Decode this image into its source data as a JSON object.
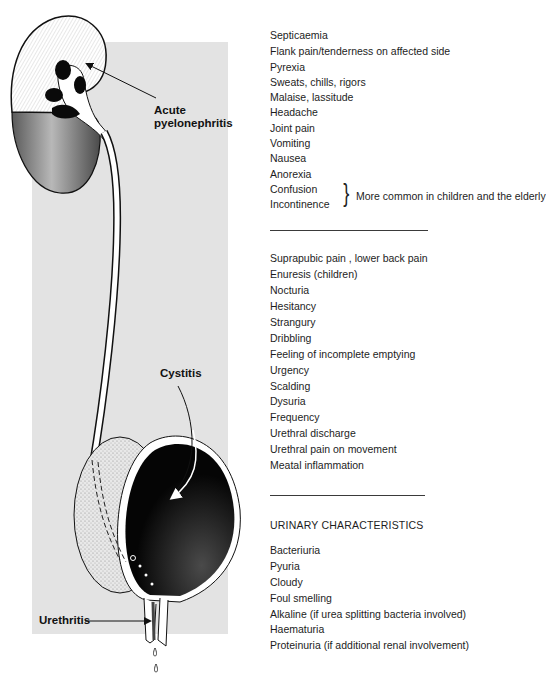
{
  "illustration": {
    "labels": {
      "kidney": [
        "Acute",
        "pyelonephritis"
      ],
      "bladder": "Cystitis",
      "urethra": "Urethritis"
    },
    "colors": {
      "panel_background": "#e3e3e3",
      "ink": "#111111",
      "cortex_shade": "#9a9a9a"
    }
  },
  "upper_tract_symptoms": {
    "items": [
      "Septicaemia",
      "Flank pain/tenderness on affected side",
      "Pyrexia",
      "Sweats, chills, rigors",
      "Malaise, lassitude",
      "Headache",
      "Joint pain",
      "Vomiting",
      "Nausea",
      "Anorexia",
      "Confusion",
      "Incontinence"
    ],
    "bracket_note": "More common in children and the elderly"
  },
  "lower_tract_symptoms": {
    "items": [
      "Suprapubic pain ,  lower back pain",
      "Enuresis  (children)",
      "Nocturia",
      "Hesitancy",
      "Strangury",
      "Dribbling",
      "Feeling of incomplete emptying",
      "Urgency",
      "Scalding",
      "Dysuria",
      "Frequency",
      "Urethral discharge",
      "Urethral pain on movement",
      "Meatal inflammation"
    ]
  },
  "urinary_characteristics": {
    "heading": "URINARY CHARACTERISTICS",
    "items": [
      "Bacteriuria",
      "Pyuria",
      "Cloudy",
      "Foul smelling",
      "Alkaline (if urea splitting bacteria involved)",
      "Haematuria",
      "Proteinuria (if additional renal involvement)"
    ]
  }
}
